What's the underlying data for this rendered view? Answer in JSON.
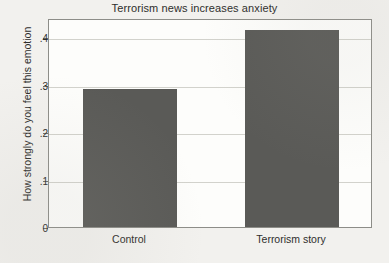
{
  "chart_data": {
    "type": "bar",
    "title": "Terrorism news increases anxiety",
    "xlabel": "",
    "ylabel": "How strongly do you feel this emotion",
    "categories": [
      "Control",
      "Terrorism story"
    ],
    "values": [
      0.29,
      0.415
    ],
    "ylim": [
      0,
      0.44
    ],
    "ytick_values": [
      0,
      0.1,
      0.2,
      0.3,
      0.4
    ],
    "ytick_labels": [
      "0",
      ".1",
      ".2",
      ".3",
      ".4"
    ],
    "grid": true,
    "grid_axis": "y",
    "legend": false,
    "bar_color": "#5a5a57",
    "frame_color": "#8d8d88",
    "grid_color": "#d2d2cc",
    "plot_background": "#fdfdfb",
    "figure_background": "#f2f1ee",
    "text_color": "#2e2e2c"
  }
}
